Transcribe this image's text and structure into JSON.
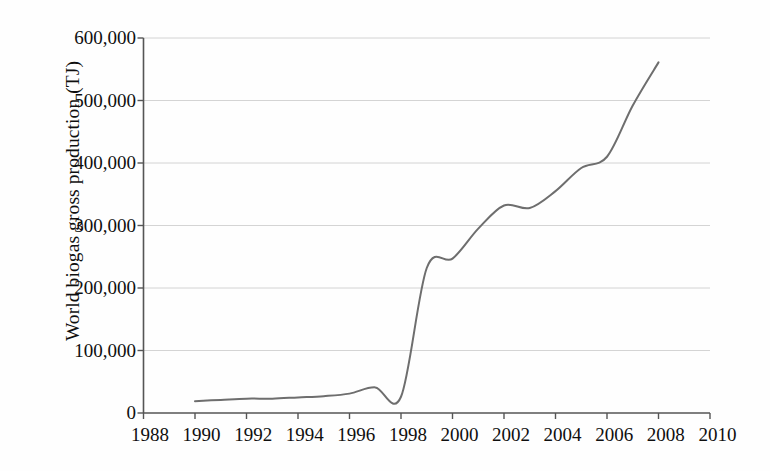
{
  "chart_data": {
    "type": "line",
    "title": "",
    "subtitle": "",
    "xlabel": "",
    "ylabel": "World biogas gross production (TJ)",
    "xlim": [
      1988,
      2010
    ],
    "ylim": [
      0,
      600000
    ],
    "grid": true,
    "grid_axis": "y",
    "legend": null,
    "legend_position": "none",
    "x_tick_labels": [
      "1988",
      "1990",
      "1992",
      "1994",
      "1996",
      "1998",
      "2000",
      "2002",
      "2004",
      "2006",
      "2008",
      "2010"
    ],
    "x_ticks": [
      1988,
      1990,
      1992,
      1994,
      1996,
      1998,
      2000,
      2002,
      2004,
      2006,
      2008,
      2010
    ],
    "y_tick_labels": [
      "0",
      "100,000",
      "200,000",
      "300,000",
      "400,000",
      "500,000",
      "600,000"
    ],
    "y_ticks": [
      0,
      100000,
      200000,
      300000,
      400000,
      500000,
      600000
    ],
    "series": [
      {
        "name": "World biogas gross production",
        "color": "#6e6e6e",
        "x": [
          1990,
          1991,
          1992,
          1993,
          1994,
          1995,
          1996,
          1997,
          1998,
          1999,
          2000,
          2001,
          2002,
          2003,
          2004,
          2005,
          2006,
          2007,
          2008
        ],
        "values": [
          19000,
          21000,
          23000,
          23000,
          25000,
          27000,
          31000,
          41000,
          26000,
          232000,
          247000,
          295000,
          332000,
          328000,
          355000,
          392000,
          410000,
          492000,
          561000
        ]
      }
    ]
  },
  "axis": {
    "line_color": "#555555",
    "grid_color": "#cfcfcf",
    "tick_color": "#555555"
  },
  "page": {
    "background": "#fefefe"
  }
}
